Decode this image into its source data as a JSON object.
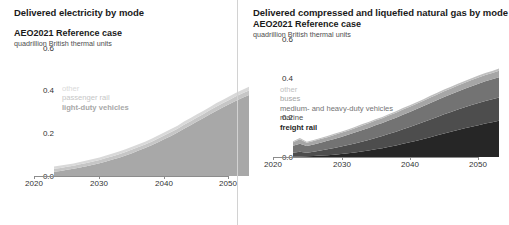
{
  "left": {
    "title": "Delivered electricity by mode",
    "subtitle": "AEO2021 Reference case",
    "units": "quadrillion British thermal units",
    "yticks": [
      "0.6",
      "0.4",
      "0.2",
      "0.0"
    ],
    "xticks": [
      "2020",
      "2030",
      "2040",
      "2050"
    ],
    "legend": [
      {
        "label": "other",
        "color": "#d9d9d9"
      },
      {
        "label": "passenger rail",
        "color": "#c6c6c6"
      },
      {
        "label": "light-duty vehicles",
        "color": "#a8a8a8"
      }
    ]
  },
  "right": {
    "title": "Delivered compressed and liquefied natural gas by mode",
    "subtitle": "AEO2021 Reference case",
    "units": "quadrillion British thermal units",
    "yticks": [
      "0.6",
      "0.4",
      "0.2",
      "0.0"
    ],
    "xticks": [
      "2020",
      "2030",
      "2040",
      "2050"
    ],
    "legend": [
      {
        "label": "other",
        "color": "#bfbfbf"
      },
      {
        "label": "buses",
        "color": "#a6a6a6"
      },
      {
        "label": "medium- and heavy-duty vehicles",
        "color": "#737373"
      },
      {
        "label": "marine",
        "color": "#4d4d4d"
      },
      {
        "label": "freight rail",
        "color": "#262626"
      }
    ]
  },
  "chart_data": [
    {
      "type": "area",
      "title": "Delivered electricity by mode",
      "subtitle": "AEO2021 Reference case",
      "ylabel": "quadrillion British thermal units",
      "xlabel": "",
      "ylim": [
        0,
        0.6
      ],
      "xlim": [
        2020,
        2050
      ],
      "ytick_values": [
        0.0,
        0.2,
        0.4,
        0.6
      ],
      "xtick_values": [
        2020,
        2030,
        2040,
        2050
      ],
      "grid": false,
      "legend_position": "inside-upper-left",
      "stacked": true,
      "x": [
        2020,
        2021,
        2022,
        2023,
        2024,
        2025,
        2026,
        2027,
        2028,
        2029,
        2030,
        2031,
        2032,
        2033,
        2034,
        2035,
        2036,
        2037,
        2038,
        2039,
        2040,
        2041,
        2042,
        2043,
        2044,
        2045,
        2046,
        2047,
        2048,
        2049,
        2050
      ],
      "series": [
        {
          "name": "light-duty vehicles",
          "color": "#a8a8a8",
          "values": [
            0.02,
            0.024,
            0.029,
            0.034,
            0.04,
            0.046,
            0.053,
            0.06,
            0.068,
            0.077,
            0.086,
            0.096,
            0.107,
            0.119,
            0.131,
            0.144,
            0.158,
            0.173,
            0.188,
            0.204,
            0.221,
            0.238,
            0.255,
            0.272,
            0.289,
            0.306,
            0.322,
            0.338,
            0.353,
            0.367,
            0.38
          ]
        },
        {
          "name": "passenger rail",
          "color": "#c6c6c6",
          "values": [
            0.014,
            0.014,
            0.014,
            0.014,
            0.015,
            0.015,
            0.015,
            0.015,
            0.016,
            0.016,
            0.016,
            0.016,
            0.017,
            0.017,
            0.017,
            0.017,
            0.018,
            0.018,
            0.018,
            0.018,
            0.019,
            0.019,
            0.019,
            0.019,
            0.02,
            0.02,
            0.02,
            0.02,
            0.021,
            0.021,
            0.021
          ]
        },
        {
          "name": "other",
          "color": "#d9d9d9",
          "values": [
            0.011,
            0.011,
            0.011,
            0.011,
            0.011,
            0.012,
            0.012,
            0.012,
            0.012,
            0.012,
            0.013,
            0.013,
            0.013,
            0.013,
            0.013,
            0.014,
            0.014,
            0.014,
            0.014,
            0.014,
            0.015,
            0.015,
            0.015,
            0.015,
            0.015,
            0.016,
            0.016,
            0.016,
            0.016,
            0.016,
            0.017
          ]
        }
      ],
      "total_2020": 0.045,
      "total_2050": 0.418
    },
    {
      "type": "area",
      "title": "Delivered compressed and liquefied natural gas by mode",
      "subtitle": "AEO2021 Reference case",
      "ylabel": "quadrillion British thermal units",
      "xlabel": "",
      "ylim": [
        0,
        0.6
      ],
      "xlim": [
        2020,
        2050
      ],
      "ytick_values": [
        0.0,
        0.2,
        0.4,
        0.6
      ],
      "xtick_values": [
        2020,
        2030,
        2040,
        2050
      ],
      "grid": false,
      "legend_position": "inside-upper-left",
      "stacked": true,
      "x": [
        2020,
        2021,
        2022,
        2023,
        2024,
        2025,
        2026,
        2027,
        2028,
        2029,
        2030,
        2031,
        2032,
        2033,
        2034,
        2035,
        2036,
        2037,
        2038,
        2039,
        2040,
        2041,
        2042,
        2043,
        2044,
        2045,
        2046,
        2047,
        2048,
        2049,
        2050
      ],
      "series": [
        {
          "name": "freight rail",
          "color": "#262626",
          "values": [
            0.002,
            0.003,
            0.004,
            0.005,
            0.007,
            0.009,
            0.012,
            0.015,
            0.019,
            0.023,
            0.028,
            0.033,
            0.039,
            0.045,
            0.052,
            0.059,
            0.067,
            0.075,
            0.083,
            0.092,
            0.101,
            0.11,
            0.119,
            0.128,
            0.137,
            0.146,
            0.154,
            0.162,
            0.17,
            0.177,
            0.184
          ]
        },
        {
          "name": "marine",
          "color": "#4d4d4d",
          "values": [
            0.02,
            0.024,
            0.018,
            0.022,
            0.026,
            0.03,
            0.034,
            0.038,
            0.042,
            0.046,
            0.05,
            0.054,
            0.058,
            0.062,
            0.066,
            0.07,
            0.074,
            0.078,
            0.082,
            0.086,
            0.09,
            0.094,
            0.098,
            0.101,
            0.104,
            0.107,
            0.11,
            0.113,
            0.115,
            0.117,
            0.119
          ]
        },
        {
          "name": "medium- and heavy-duty vehicles",
          "color": "#737373",
          "values": [
            0.035,
            0.041,
            0.034,
            0.037,
            0.04,
            0.043,
            0.046,
            0.049,
            0.052,
            0.055,
            0.058,
            0.061,
            0.064,
            0.066,
            0.069,
            0.071,
            0.074,
            0.076,
            0.079,
            0.081,
            0.084,
            0.086,
            0.088,
            0.09,
            0.092,
            0.094,
            0.096,
            0.098,
            0.1,
            0.101,
            0.103
          ]
        },
        {
          "name": "buses",
          "color": "#a6a6a6",
          "values": [
            0.018,
            0.022,
            0.016,
            0.017,
            0.018,
            0.019,
            0.02,
            0.021,
            0.021,
            0.022,
            0.023,
            0.023,
            0.024,
            0.024,
            0.025,
            0.025,
            0.026,
            0.026,
            0.027,
            0.027,
            0.028,
            0.028,
            0.029,
            0.029,
            0.03,
            0.03,
            0.031,
            0.031,
            0.032,
            0.032,
            0.033
          ]
        },
        {
          "name": "other",
          "color": "#bfbfbf",
          "values": [
            0.005,
            0.006,
            0.005,
            0.005,
            0.005,
            0.006,
            0.006,
            0.006,
            0.006,
            0.006,
            0.007,
            0.007,
            0.007,
            0.007,
            0.007,
            0.008,
            0.008,
            0.008,
            0.008,
            0.008,
            0.009,
            0.009,
            0.009,
            0.009,
            0.009,
            0.01,
            0.01,
            0.01,
            0.01,
            0.01,
            0.011
          ]
        }
      ],
      "total_2020": 0.08,
      "total_2050": 0.45
    }
  ]
}
